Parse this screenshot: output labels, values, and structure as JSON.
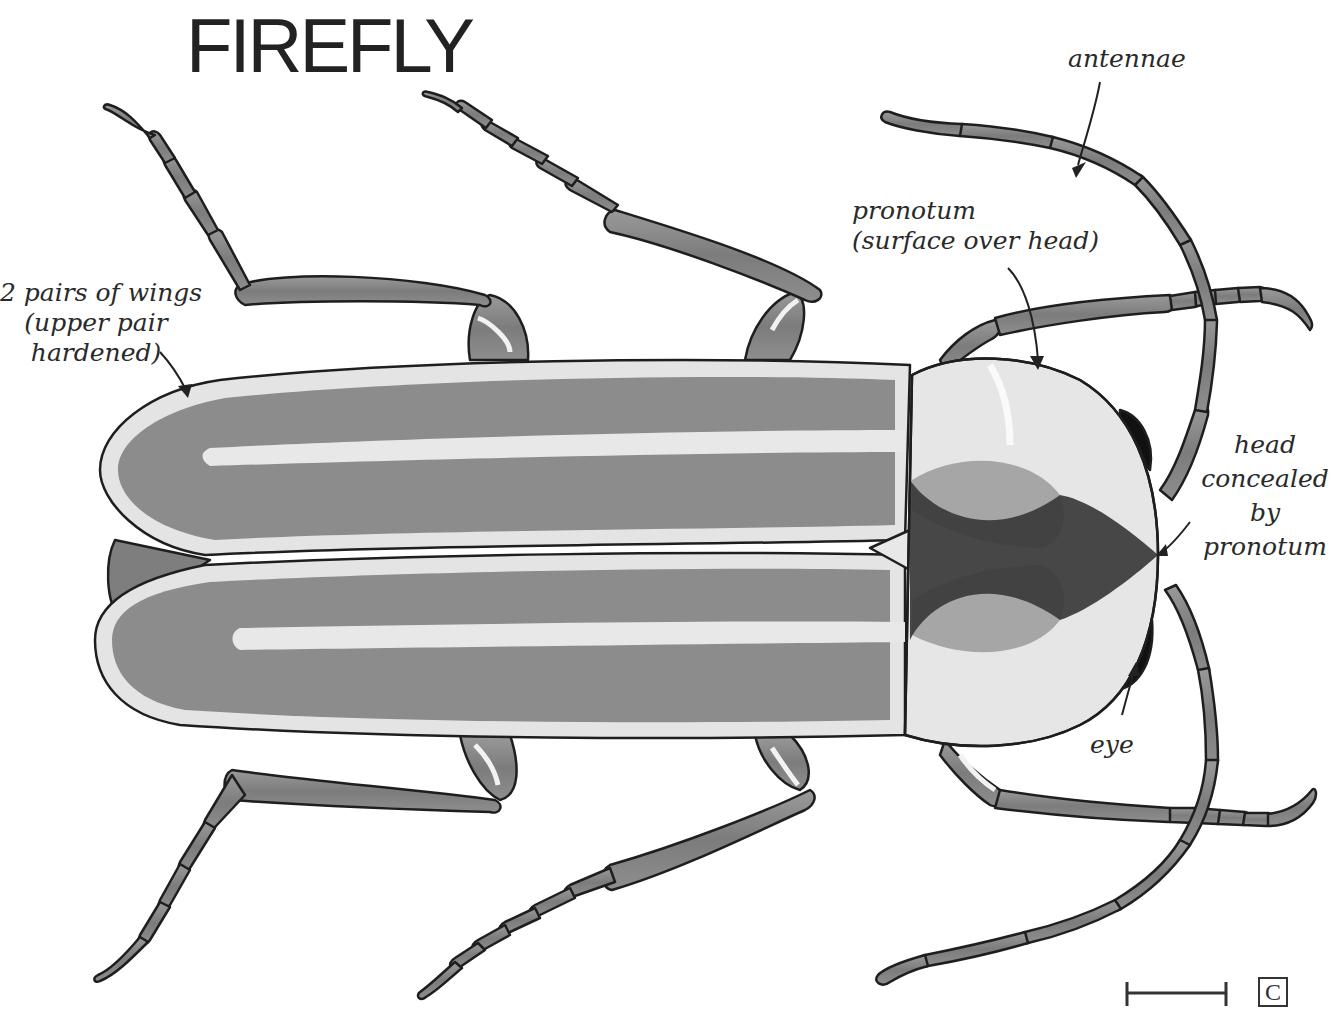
{
  "title": "FIREFLY",
  "labels": {
    "antennae": "antennae",
    "pronotum": {
      "line1": "pronotum",
      "line2": "(surface over head)"
    },
    "wings": {
      "line1": "2 pairs of wings",
      "line2": "(upper pair",
      "line3": "hardened)"
    },
    "head": {
      "line1": "head",
      "line2": "concealed",
      "line3": "by",
      "line4": "pronotum"
    },
    "eye": "eye"
  },
  "scale_bar": {
    "box_letter": "C"
  },
  "colors": {
    "outline": "#1e1e1e",
    "wing_fill": "#8c8c8c",
    "wing_edge": "#e4e4e4",
    "pronotum_fill": "#e6e6e6",
    "spot_fill": "#a6a6a6",
    "dark_mark": "#3a3a3a",
    "leg_fill": "#8a8a8a",
    "eye_fill": "#111111"
  }
}
